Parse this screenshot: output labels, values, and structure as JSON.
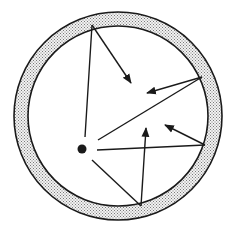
{
  "diagram": {
    "colors": {
      "stroke": "#1a1a1a",
      "wall_fill": "#c8c8c8",
      "background": "#ffffff"
    },
    "cavity": {
      "cx": 118,
      "cy": 116,
      "outer_r": 104,
      "inner_r": 90
    },
    "source": {
      "cx": 82,
      "cy": 149,
      "r": 4.5
    },
    "rays": [
      {
        "id": "ray-1",
        "from": [
          85,
          137
        ],
        "reflect": [
          92,
          25
        ],
        "arrow_tip": [
          131,
          83
        ]
      },
      {
        "id": "ray-2",
        "from": [
          98,
          140
        ],
        "reflect": [
          202,
          77
        ],
        "arrow_tip": [
          147,
          93
        ]
      },
      {
        "id": "ray-3",
        "from": [
          97,
          150
        ],
        "reflect": [
          205,
          145
        ],
        "arrow_tip": [
          165,
          125
        ]
      },
      {
        "id": "ray-4",
        "from": [
          92,
          160
        ],
        "reflect": [
          141,
          206
        ],
        "arrow_tip": [
          146,
          128
        ]
      }
    ]
  }
}
